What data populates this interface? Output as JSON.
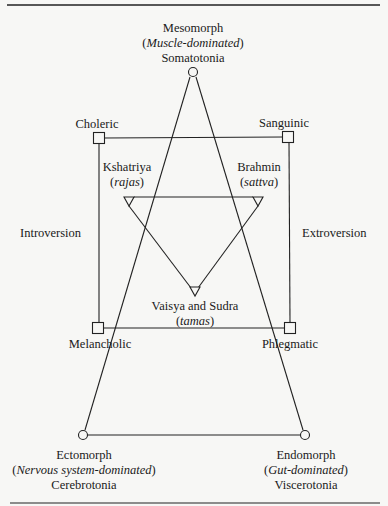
{
  "diagram": {
    "type": "typology-diagram",
    "somatotypes": {
      "mesomorph": {
        "name": "Mesomorph",
        "qualifier": "Muscle-dominated",
        "temperament": "Somatotonia"
      },
      "ectomorph": {
        "name": "Ectomorph",
        "qualifier": "Nervous system-dominated",
        "temperament": "Cerebrotonia"
      },
      "endomorph": {
        "name": "Endomorph",
        "qualifier": "Gut-dominated",
        "temperament": "Viscerotonia"
      }
    },
    "humors": {
      "choleric": "Choleric",
      "sanguinic": "Sanguinic",
      "melancholic": "Melancholic",
      "phlegmatic": "Phlegmatic"
    },
    "castes": {
      "kshatriya": {
        "name": "Kshatriya",
        "guna": "rajas"
      },
      "brahmin": {
        "name": "Brahmin",
        "guna": "sattva"
      },
      "vaisya_sudra": {
        "name": "Vaisya and Sudra",
        "guna": "tamas"
      }
    },
    "axes": {
      "left": "Introversion",
      "right": "Extroversion"
    },
    "nodes": [
      {
        "id": "mesomorph",
        "shape": "circle",
        "x": 193,
        "y": 72
      },
      {
        "id": "ectomorph",
        "shape": "circle",
        "x": 83,
        "y": 435
      },
      {
        "id": "endomorph",
        "shape": "circle",
        "x": 305,
        "y": 435
      },
      {
        "id": "choleric",
        "shape": "square",
        "x": 99,
        "y": 138
      },
      {
        "id": "sanguinic",
        "shape": "square",
        "x": 288,
        "y": 137
      },
      {
        "id": "melancholic",
        "shape": "square",
        "x": 98,
        "y": 328
      },
      {
        "id": "phlegmatic",
        "shape": "square",
        "x": 290,
        "y": 328
      },
      {
        "id": "kshatriya",
        "shape": "triangle-down",
        "x": 129,
        "y": 201
      },
      {
        "id": "brahmin",
        "shape": "triangle-down",
        "x": 258,
        "y": 201
      },
      {
        "id": "vaisya_sudra",
        "shape": "triangle-down",
        "x": 195,
        "y": 290
      }
    ]
  }
}
